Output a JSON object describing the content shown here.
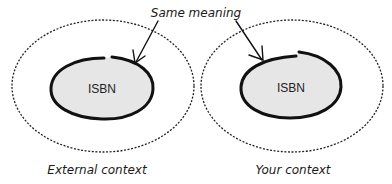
{
  "annotation": {
    "label": "Same meaning"
  },
  "contexts": [
    {
      "name": "External context",
      "term": "ISBN"
    },
    {
      "name": "Your context",
      "term": "ISBN"
    }
  ],
  "colors": {
    "inner_fill": "#e6e6e6",
    "stroke": "#111111",
    "background": "#ffffff"
  }
}
